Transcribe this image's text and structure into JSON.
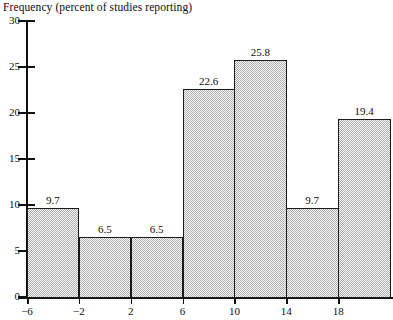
{
  "chart_data": {
    "type": "bar",
    "title": "Frequency (percent of studies reporting)",
    "xlabel": "",
    "ylabel": "",
    "categories": [
      "-6",
      "-2",
      "2",
      "6",
      "10",
      "14",
      "18"
    ],
    "values": [
      9.7,
      6.5,
      6.5,
      22.6,
      25.8,
      9.7,
      19.4
    ],
    "data_labels": [
      "9.7",
      "6.5",
      "6.5",
      "22.6",
      "25.8",
      "9.7",
      "19.4"
    ],
    "ylim": [
      0,
      30
    ],
    "y_ticks": [
      0,
      5,
      10,
      15,
      20,
      25,
      30
    ],
    "y_tick_labels": [
      "0",
      "5",
      "10",
      "15",
      "20",
      "25",
      "30"
    ],
    "x_tick_labels": [
      "−6",
      "−2",
      "2",
      "6",
      "10",
      "14",
      "18"
    ],
    "grid": false,
    "legend": null,
    "bin_width": 4,
    "bar_fill_color": "#c9c9c9",
    "bar_edge_color": "#1a1a1a",
    "axis_color": "#111111",
    "text_color": "#0d0d0d",
    "background_color": "#ffffff"
  }
}
